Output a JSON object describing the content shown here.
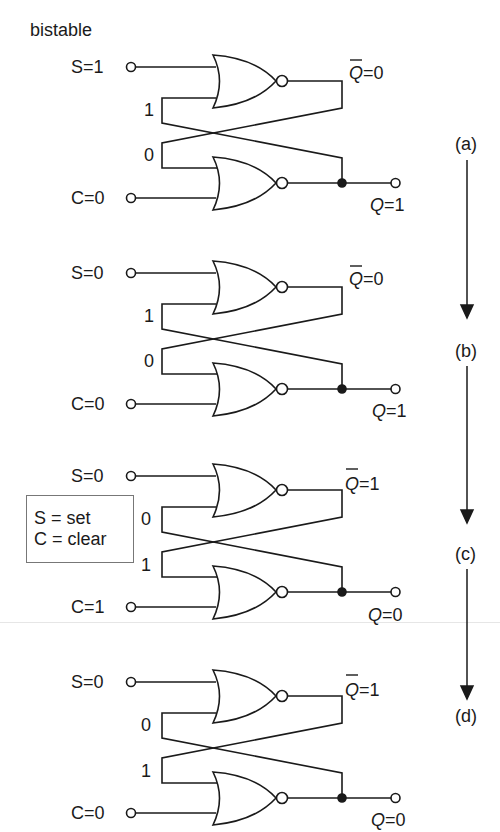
{
  "title": "bistable",
  "legend": {
    "lines": [
      "S = set",
      "C = clear"
    ]
  },
  "stages": [
    {
      "id": "a",
      "label": "(a)",
      "inputs": {
        "S": "S=1",
        "C": "C=0"
      },
      "feedback": {
        "top": "1",
        "bottom": "0"
      },
      "outputs": {
        "Qbar_symbol": "Q",
        "Qbar_value": "=0",
        "Q_symbol": "Q",
        "Q_value": "=1"
      }
    },
    {
      "id": "b",
      "label": "(b)",
      "inputs": {
        "S": "S=0",
        "C": "C=0"
      },
      "feedback": {
        "top": "1",
        "bottom": "0"
      },
      "outputs": {
        "Qbar_symbol": "Q",
        "Qbar_value": "=0",
        "Q_symbol": "Q",
        "Q_value": "=1"
      }
    },
    {
      "id": "c",
      "label": "(c)",
      "inputs": {
        "S": "S=0",
        "C": "C=1"
      },
      "feedback": {
        "top": "0",
        "bottom": "1"
      },
      "outputs": {
        "Qbar_symbol": "Q",
        "Qbar_value": "=1",
        "Q_symbol": "Q",
        "Q_value": "=0"
      }
    },
    {
      "id": "d",
      "label": "(d)",
      "inputs": {
        "S": "S=0",
        "C": "C=0"
      },
      "feedback": {
        "top": "0",
        "bottom": "1"
      },
      "outputs": {
        "Qbar_symbol": "Q",
        "Qbar_value": "=1",
        "Q_symbol": "Q",
        "Q_value": "=0"
      }
    }
  ],
  "gate_type": "NOR",
  "colors": {
    "ink": "#1a1a1a",
    "background": "#ffffff",
    "legend_border": "#777777"
  }
}
